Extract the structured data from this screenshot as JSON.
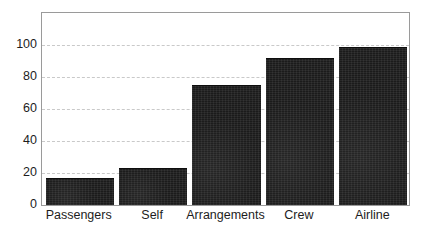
{
  "chart_data": {
    "type": "bar",
    "title": "",
    "subtitle": "",
    "xlabel": "",
    "ylabel": "",
    "categories": [
      "Passengers",
      "Self",
      "Arrangements",
      "Crew",
      "Airline"
    ],
    "values": [
      17,
      23,
      75,
      92,
      99
    ],
    "series": [
      {
        "name": "",
        "values": [
          17,
          23,
          75,
          92,
          99
        ]
      }
    ],
    "ylim": [
      0,
      120
    ],
    "xlim_note": "categorical",
    "yticks": [
      0,
      20,
      40,
      60,
      80,
      100
    ],
    "ytick_labels": [
      "0",
      "20",
      "40",
      "60",
      "80",
      "100"
    ],
    "grid": "horizontal-dashed",
    "legend": "none",
    "bar_color": "#1b1b1b",
    "grid_color": "#c9c9c9",
    "frame_color": "#9a9a9a",
    "background_color": "#ffffff",
    "text_color": "#1d1d1d",
    "annotations": []
  }
}
